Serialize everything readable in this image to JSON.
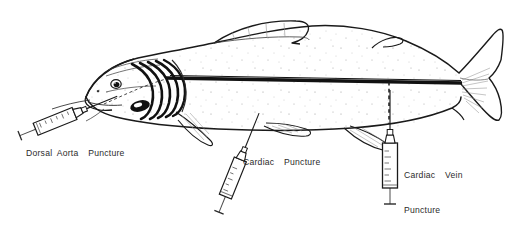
{
  "figure": {
    "background_color": "#ffffff",
    "ink_color": "#1a1a1a",
    "text_color": "#2b2b2b"
  },
  "labels": {
    "dorsal_aorta": "Dorsal Aorta  Puncture",
    "cardiac_puncture": "Cardiac  Puncture",
    "cardiac_vein_line1": "Cardiac  Vein",
    "cardiac_vein_line2": "Puncture",
    "cardiac_vein_line3": "Ventral  Insertion"
  },
  "annotations": {
    "syringe_left": "syringe-dorsal-aorta",
    "syringe_middle": "syringe-cardiac-puncture",
    "syringe_right": "syringe-cardiac-vein",
    "guide_line": "dashed-vertical-guide-line",
    "lateral_line": "vertebral-lateral-line"
  }
}
